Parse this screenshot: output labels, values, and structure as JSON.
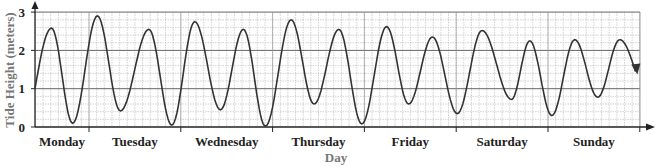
{
  "chart_data": {
    "type": "line",
    "title": "",
    "xlabel": "Day",
    "ylabel": "Tide Height (meters)",
    "ylim": [
      0,
      3
    ],
    "yticks": [
      0,
      1,
      2,
      3
    ],
    "ytick_labels": [
      "0",
      "1",
      "2",
      "3"
    ],
    "categories": [
      "Monday",
      "Tuesday",
      "Wednesday",
      "Thursday",
      "Friday",
      "Saturday",
      "Sunday"
    ],
    "grid": true,
    "grid_minor": {
      "x_per_day": 12,
      "y_step": 0.2
    },
    "x_units": "days (0 = start of plotted Monday portion, tick marks at day boundaries)",
    "series": [
      {
        "name": "Tide Height",
        "points": [
          {
            "x": 0.0,
            "y": 1.0
          },
          {
            "x": 0.18,
            "y": 2.58
          },
          {
            "x": 0.41,
            "y": 0.1
          },
          {
            "x": 0.68,
            "y": 2.9
          },
          {
            "x": 0.93,
            "y": 0.42
          },
          {
            "x": 1.24,
            "y": 2.55
          },
          {
            "x": 1.49,
            "y": 0.05
          },
          {
            "x": 1.74,
            "y": 2.75
          },
          {
            "x": 2.02,
            "y": 0.45
          },
          {
            "x": 2.27,
            "y": 2.55
          },
          {
            "x": 2.51,
            "y": 0.02
          },
          {
            "x": 2.79,
            "y": 2.8
          },
          {
            "x": 3.04,
            "y": 0.6
          },
          {
            "x": 3.31,
            "y": 2.55
          },
          {
            "x": 3.56,
            "y": 0.08
          },
          {
            "x": 3.83,
            "y": 2.62
          },
          {
            "x": 4.07,
            "y": 0.6
          },
          {
            "x": 4.33,
            "y": 2.35
          },
          {
            "x": 4.6,
            "y": 0.35
          },
          {
            "x": 4.87,
            "y": 2.52
          },
          {
            "x": 5.19,
            "y": 0.72
          },
          {
            "x": 5.39,
            "y": 2.25
          },
          {
            "x": 5.63,
            "y": 0.3
          },
          {
            "x": 5.88,
            "y": 2.28
          },
          {
            "x": 6.13,
            "y": 0.78
          },
          {
            "x": 6.37,
            "y": 2.28
          },
          {
            "x": 6.54,
            "y": 1.45
          }
        ]
      }
    ]
  },
  "layout": {
    "origin_x": 35,
    "origin_y": 127,
    "px_per_meter": 38.3,
    "first_day_tick_x": 89,
    "px_per_day": 91.8,
    "x_start_day": -0.588,
    "plot_right_x": 640,
    "plot_top_y": 12,
    "curve_color": "#333333",
    "grid_color": "#b5b5b5",
    "axis_color": "#222222"
  }
}
